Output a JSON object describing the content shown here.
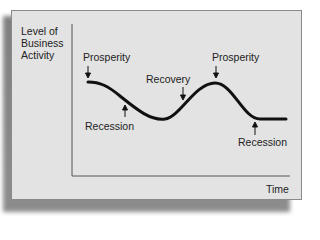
{
  "diagram": {
    "y_axis_label": [
      "Level of",
      "Business",
      "Activity"
    ],
    "x_axis_label": "Time",
    "phases": [
      {
        "label": "Prosperity",
        "arrow": "down"
      },
      {
        "label": "Recession",
        "arrow": "up"
      },
      {
        "label": "Recovery",
        "arrow": "down"
      },
      {
        "label": "Prosperity",
        "arrow": "down"
      },
      {
        "label": "Recession",
        "arrow": "up"
      }
    ],
    "colors": {
      "panel": "#e3e3e3",
      "curve": "#111111",
      "axis": "#555555",
      "shadow": "#707070"
    }
  }
}
